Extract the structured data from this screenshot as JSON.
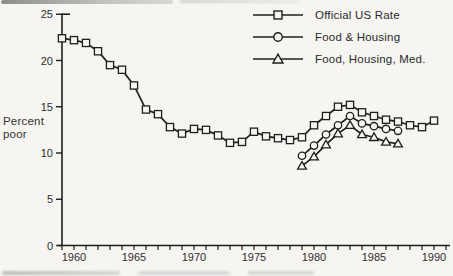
{
  "chart_data": {
    "type": "line",
    "title": "",
    "ylabel": "Percent poor",
    "ylabel_lines": [
      "Percent",
      "poor"
    ],
    "ylim": [
      0,
      25
    ],
    "yticks": [
      0,
      5,
      10,
      15,
      20,
      25
    ],
    "xlim": [
      1959,
      1991
    ],
    "xtick_labels": [
      1960,
      1965,
      1970,
      1975,
      1980,
      1985,
      1990
    ],
    "minor_xtick_step_years": 1,
    "grid": false,
    "legend_position": "top-right",
    "ink_color": "#1f1f1f",
    "paper_color": "#f6f5f2",
    "series": [
      {
        "name": "Official US Rate",
        "marker": "square",
        "x_start": 1959,
        "x_end": 1990,
        "values": [
          22.4,
          22.2,
          21.9,
          21.0,
          19.5,
          19.0,
          17.3,
          14.7,
          14.2,
          12.8,
          12.1,
          12.6,
          12.5,
          11.9,
          11.1,
          11.2,
          12.3,
          11.8,
          11.6,
          11.4,
          11.7,
          13.0,
          14.0,
          15.0,
          15.2,
          14.4,
          14.0,
          13.6,
          13.4,
          13.0,
          12.8,
          13.5
        ]
      },
      {
        "name": "Food & Housing",
        "marker": "circle",
        "x_start": 1979,
        "x_end": 1987,
        "values": [
          9.7,
          10.8,
          12.0,
          13.0,
          14.0,
          13.2,
          12.9,
          12.6,
          12.4
        ]
      },
      {
        "name": "Food, Housing, Med.",
        "marker": "triangle",
        "x_start": 1979,
        "x_end": 1987,
        "values": [
          8.6,
          9.6,
          10.9,
          12.1,
          13.0,
          12.0,
          11.7,
          11.2,
          11.0
        ]
      }
    ]
  }
}
